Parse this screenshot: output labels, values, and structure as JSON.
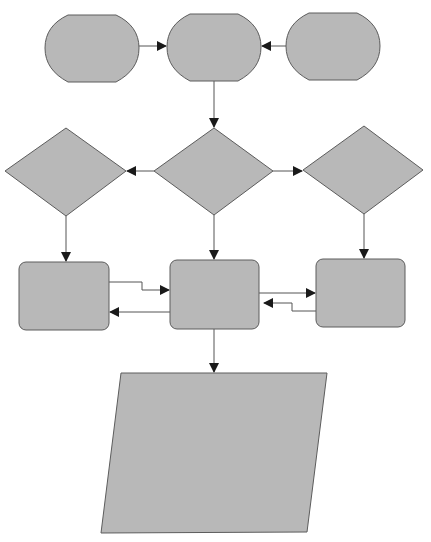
{
  "diagram": {
    "type": "flowchart",
    "colors": {
      "background": "#ffffff",
      "shape_fill": "#b8b8b8",
      "shape_stroke": "#5c5c5c",
      "connector": "#555555",
      "arrowhead": "#1a1a1a"
    },
    "nodes": [
      {
        "id": "start-left",
        "shape": "terminator",
        "label": ""
      },
      {
        "id": "start-center",
        "shape": "terminator",
        "label": ""
      },
      {
        "id": "start-right",
        "shape": "terminator",
        "label": ""
      },
      {
        "id": "decision-left",
        "shape": "diamond",
        "label": ""
      },
      {
        "id": "decision-center",
        "shape": "diamond",
        "label": ""
      },
      {
        "id": "decision-right",
        "shape": "diamond",
        "label": ""
      },
      {
        "id": "process-left",
        "shape": "rounded-rectangle",
        "label": ""
      },
      {
        "id": "process-center",
        "shape": "rounded-rectangle",
        "label": ""
      },
      {
        "id": "process-right",
        "shape": "rounded-rectangle",
        "label": ""
      },
      {
        "id": "data-output",
        "shape": "parallelogram",
        "label": ""
      }
    ],
    "edges": [
      {
        "from": "start-left",
        "to": "start-center",
        "label": ""
      },
      {
        "from": "start-right",
        "to": "start-center",
        "label": ""
      },
      {
        "from": "start-center",
        "to": "decision-center",
        "label": ""
      },
      {
        "from": "decision-center",
        "to": "decision-left",
        "label": ""
      },
      {
        "from": "decision-center",
        "to": "decision-right",
        "label": ""
      },
      {
        "from": "decision-left",
        "to": "process-left",
        "label": ""
      },
      {
        "from": "decision-center",
        "to": "process-center",
        "label": ""
      },
      {
        "from": "decision-right",
        "to": "process-right",
        "label": ""
      },
      {
        "from": "process-left",
        "to": "process-center",
        "label": ""
      },
      {
        "from": "process-center",
        "to": "process-left",
        "label": ""
      },
      {
        "from": "process-center",
        "to": "process-right",
        "label": ""
      },
      {
        "from": "process-right",
        "to": "process-center",
        "label": ""
      },
      {
        "from": "process-center",
        "to": "data-output",
        "label": ""
      }
    ]
  }
}
